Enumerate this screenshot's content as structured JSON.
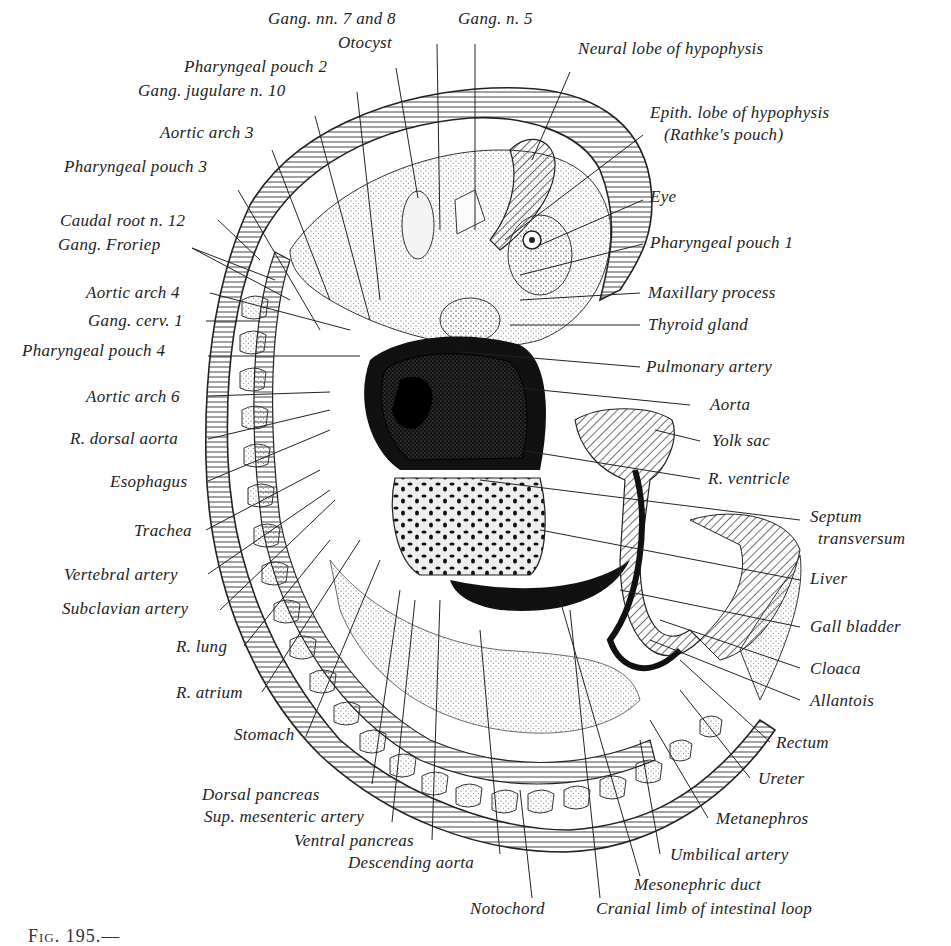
{
  "figure": {
    "caption_fragment": "Fig. 195.—",
    "labels_top": [
      {
        "id": "gang-nn-7-8",
        "text": "Gang. nn. 7 and 8",
        "x": 268,
        "y": 18
      },
      {
        "id": "gang-n-5",
        "text": "Gang. n. 5",
        "x": 458,
        "y": 18
      },
      {
        "id": "otocyst",
        "text": "Otocyst",
        "x": 338,
        "y": 42
      },
      {
        "id": "neural-lobe-hypophysis",
        "text": "Neural lobe of hypophysis",
        "x": 578,
        "y": 48
      },
      {
        "id": "pharyngeal-pouch-2",
        "text": "Pharyngeal pouch 2",
        "x": 184,
        "y": 66
      },
      {
        "id": "gang-jugulare-n10",
        "text": "Gang. jugulare n. 10",
        "x": 138,
        "y": 90
      },
      {
        "id": "epith-lobe-hypophysis",
        "text": "Epith. lobe of hypophysis",
        "x": 650,
        "y": 112
      },
      {
        "id": "rathkes-pouch",
        "text": "(Rathke's pouch)",
        "x": 664,
        "y": 134
      },
      {
        "id": "aortic-arch-3",
        "text": "Aortic arch 3",
        "x": 160,
        "y": 124
      },
      {
        "id": "pharyngeal-pouch-3",
        "text": "Pharyngeal pouch 3",
        "x": 64,
        "y": 158
      },
      {
        "id": "eye",
        "text": "Eye",
        "x": 650,
        "y": 188
      },
      {
        "id": "caudal-root-n12",
        "text": "Caudal root n. 12",
        "x": 60,
        "y": 212
      },
      {
        "id": "gang-froriep",
        "text": "Gang. Froriep",
        "x": 58,
        "y": 236
      },
      {
        "id": "pharyngeal-pouch-1",
        "text": "Pharyngeal pouch 1",
        "x": 650,
        "y": 234
      }
    ],
    "labels_left": [
      {
        "id": "aortic-arch-4",
        "text": "Aortic arch 4",
        "x": 86,
        "y": 284
      },
      {
        "id": "gang-cerv-1",
        "text": "Gang. cerv. 1",
        "x": 88,
        "y": 312
      },
      {
        "id": "pharyngeal-pouch-4",
        "text": "Pharyngeal pouch 4",
        "x": 22,
        "y": 342
      },
      {
        "id": "aortic-arch-6",
        "text": "Aortic arch 6",
        "x": 86,
        "y": 388
      },
      {
        "id": "r-dorsal-aorta",
        "text": "R. dorsal aorta",
        "x": 70,
        "y": 430
      },
      {
        "id": "esophagus",
        "text": "Esophagus",
        "x": 110,
        "y": 473
      },
      {
        "id": "trachea",
        "text": "Trachea",
        "x": 134,
        "y": 522
      },
      {
        "id": "vertebral-artery",
        "text": "Vertebral artery",
        "x": 64,
        "y": 566
      },
      {
        "id": "subclavian-artery",
        "text": "Subclavian artery",
        "x": 62,
        "y": 600
      },
      {
        "id": "r-lung",
        "text": "R. lung",
        "x": 176,
        "y": 638
      },
      {
        "id": "r-atrium",
        "text": "R. atrium",
        "x": 176,
        "y": 684
      },
      {
        "id": "stomach",
        "text": "Stomach",
        "x": 234,
        "y": 726
      }
    ],
    "labels_right": [
      {
        "id": "maxillary-process",
        "text": "Maxillary process",
        "x": 648,
        "y": 284
      },
      {
        "id": "thyroid-gland",
        "text": "Thyroid gland",
        "x": 648,
        "y": 316
      },
      {
        "id": "pulmonary-artery",
        "text": "Pulmonary artery",
        "x": 646,
        "y": 358
      },
      {
        "id": "aorta",
        "text": "Aorta",
        "x": 710,
        "y": 396
      },
      {
        "id": "yolk-sac",
        "text": "Yolk sac",
        "x": 712,
        "y": 432
      },
      {
        "id": "r-ventricle",
        "text": "R. ventricle",
        "x": 708,
        "y": 470
      },
      {
        "id": "septum",
        "text": "Septum",
        "x": 810,
        "y": 508
      },
      {
        "id": "transversum",
        "text": "transversum",
        "x": 818,
        "y": 530
      },
      {
        "id": "liver",
        "text": "Liver",
        "x": 810,
        "y": 570
      },
      {
        "id": "gall-bladder",
        "text": "Gall bladder",
        "x": 810,
        "y": 618
      },
      {
        "id": "cloaca",
        "text": "Cloaca",
        "x": 810,
        "y": 660
      },
      {
        "id": "allantois",
        "text": "Allantois",
        "x": 810,
        "y": 692
      },
      {
        "id": "rectum",
        "text": "Rectum",
        "x": 776,
        "y": 734
      },
      {
        "id": "ureter",
        "text": "Ureter",
        "x": 758,
        "y": 770
      },
      {
        "id": "metanephros",
        "text": "Metanephros",
        "x": 716,
        "y": 810
      },
      {
        "id": "umbilical-artery",
        "text": "Umbilical artery",
        "x": 670,
        "y": 846
      }
    ],
    "labels_bottom": [
      {
        "id": "dorsal-pancreas",
        "text": "Dorsal pancreas",
        "x": 202,
        "y": 786
      },
      {
        "id": "sup-mesenteric-artery",
        "text": "Sup. mesenteric artery",
        "x": 204,
        "y": 808
      },
      {
        "id": "ventral-pancreas",
        "text": "Ventral pancreas",
        "x": 294,
        "y": 832
      },
      {
        "id": "descending-aorta",
        "text": "Descending aorta",
        "x": 348,
        "y": 854
      },
      {
        "id": "mesonephric-duct",
        "text": "Mesonephric duct",
        "x": 634,
        "y": 876
      },
      {
        "id": "notochord",
        "text": "Notochord",
        "x": 470,
        "y": 900
      },
      {
        "id": "cranial-limb-intestinal-loop",
        "text": "Cranial limb of intestinal loop",
        "x": 596,
        "y": 900
      }
    ]
  }
}
